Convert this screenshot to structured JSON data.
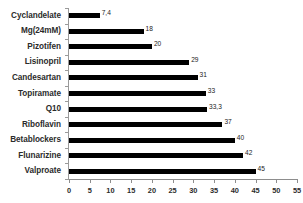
{
  "chart_data": {
    "type": "bar",
    "orientation": "horizontal",
    "title": "",
    "subtitle": "",
    "xlabel": "",
    "ylabel": "",
    "xlim": [
      0,
      55
    ],
    "xticks": [
      0,
      5,
      10,
      15,
      20,
      25,
      30,
      35,
      40,
      45,
      50,
      55
    ],
    "xtick_labels": [
      "0",
      "5",
      "10",
      "15",
      "20",
      "25",
      "30",
      "35",
      "40",
      "45",
      "50",
      "55"
    ],
    "grid": false,
    "legend": false,
    "decimal_separator": ",",
    "bar_color": "#000000",
    "axis_color": "#8d8d8d",
    "label_color": "#2b2b2b",
    "categories": [
      "Cyclandelate",
      "Mg(24mM)",
      "Pizotifen",
      "Lisinopril",
      "Candesartan",
      "Topiramate",
      "Q10",
      "Riboflavin",
      "Betablockers",
      "Flunarizine",
      "Valproate"
    ],
    "values": [
      7.4,
      18,
      20,
      29,
      31,
      33,
      33.3,
      37,
      40,
      42,
      45
    ],
    "value_labels": [
      "7,4",
      "18",
      "20",
      "29",
      "31",
      "33",
      "33,3",
      "37",
      "40",
      "42",
      "45"
    ]
  }
}
